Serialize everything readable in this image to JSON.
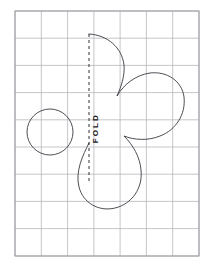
{
  "sheet": {
    "title": "Fold-line pattern template on grid",
    "background_color": "#ffffff",
    "width": 214,
    "height": 274
  },
  "grid": {
    "name": "graph-paper-grid",
    "line_color": "#b8b8bc",
    "border_color": "#9a9aa0",
    "left": 15,
    "top": 11,
    "right": 199,
    "bottom": 256,
    "columns": 7,
    "rows": 9,
    "cell_width": 26.3,
    "cell_height": 27.2
  },
  "fold_line": {
    "name": "fold-line",
    "label": "FOLD",
    "x": 89,
    "y_start": 34,
    "y_end": 183,
    "stroke_color": "#1a1a1a",
    "dash": "3 3",
    "orientation": "vertical",
    "label_rotation_deg": -90
  },
  "shapes": {
    "stroke_color": "#3a3a42",
    "stroke_width": 0.9,
    "fill": "none",
    "items": [
      {
        "name": "circle-motif",
        "type": "circle",
        "cx": 50,
        "cy": 132,
        "r": 23
      },
      {
        "name": "butterfly-half-outline",
        "type": "path",
        "description": "Half silhouette of a lobed pattern piece abutting the fold line"
      }
    ]
  },
  "paths": {
    "butterfly_half": "M 89 34 C 108 35, 122 48, 124 65 C 125 76, 121 87, 117 96 C 124 84, 136 75, 150 73 C 167 71, 182 81, 184 97 C 186 114, 176 130, 160 136 C 148 141, 134 140, 124 136 C 133 145, 140 157, 141 170 C 143 188, 132 204, 115 208 C 99 212, 83 203, 79 187 C 75 171, 83 155, 89 143 L 89 183"
  }
}
